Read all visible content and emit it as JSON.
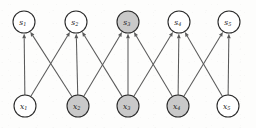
{
  "figure": {
    "type": "directed-graph",
    "width": 256,
    "height": 128,
    "background_color": "#fdfdfc"
  },
  "style": {
    "node_radius": 11,
    "node_stroke_color": "#2b2b2b",
    "node_fill_plain": "#ffffff",
    "node_fill_shaded": "#c9c9c9",
    "edge_color": "#5a5a5a",
    "label_color": "#1a1a1a"
  },
  "nodes": [
    {
      "id": "s1",
      "base": "s",
      "subscript": "1",
      "layer": "top",
      "cx": 24,
      "cy": 22,
      "shaded": false
    },
    {
      "id": "s2",
      "base": "s",
      "subscript": "2",
      "layer": "top",
      "cx": 76,
      "cy": 22,
      "shaded": false
    },
    {
      "id": "s3",
      "base": "s",
      "subscript": "3",
      "layer": "top",
      "cx": 128,
      "cy": 22,
      "shaded": true
    },
    {
      "id": "s4",
      "base": "s",
      "subscript": "4",
      "layer": "top",
      "cx": 179,
      "cy": 22,
      "shaded": false
    },
    {
      "id": "s5",
      "base": "s",
      "subscript": "5",
      "layer": "top",
      "cx": 229,
      "cy": 22,
      "shaded": false
    },
    {
      "id": "x1",
      "base": "x",
      "subscript": "1",
      "layer": "bottom",
      "cx": 25,
      "cy": 106,
      "shaded": false
    },
    {
      "id": "x2",
      "base": "x",
      "subscript": "2",
      "layer": "bottom",
      "cx": 78,
      "cy": 106,
      "shaded": true
    },
    {
      "id": "x3",
      "base": "x",
      "subscript": "3",
      "layer": "bottom",
      "cx": 128,
      "cy": 106,
      "shaded": true
    },
    {
      "id": "x4",
      "base": "x",
      "subscript": "4",
      "layer": "bottom",
      "cx": 178,
      "cy": 106,
      "shaded": true
    },
    {
      "id": "x5",
      "base": "x",
      "subscript": "5",
      "layer": "bottom",
      "cx": 228,
      "cy": 106,
      "shaded": false
    }
  ],
  "edges": [
    {
      "from": "x1",
      "to": "s1",
      "directed": true
    },
    {
      "from": "x1",
      "to": "s2",
      "directed": true
    },
    {
      "from": "x2",
      "to": "s1",
      "directed": true
    },
    {
      "from": "x2",
      "to": "s2",
      "directed": true
    },
    {
      "from": "x2",
      "to": "s3",
      "directed": true
    },
    {
      "from": "x3",
      "to": "s2",
      "directed": true
    },
    {
      "from": "x3",
      "to": "s3",
      "directed": true
    },
    {
      "from": "x3",
      "to": "s4",
      "directed": true
    },
    {
      "from": "x4",
      "to": "s3",
      "directed": true
    },
    {
      "from": "x4",
      "to": "s4",
      "directed": true
    },
    {
      "from": "x4",
      "to": "s5",
      "directed": true
    },
    {
      "from": "x5",
      "to": "s4",
      "directed": true
    },
    {
      "from": "x5",
      "to": "s5",
      "directed": true
    }
  ]
}
